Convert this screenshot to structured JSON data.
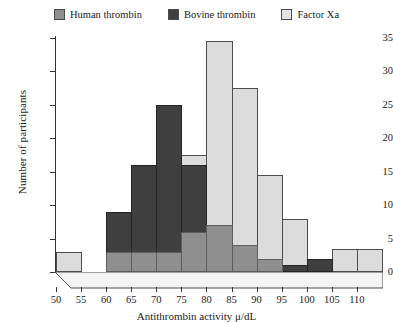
{
  "chart_data": {
    "type": "bar",
    "title": "",
    "xlabel": "Antithrombin activity μ/dL",
    "ylabel": "Number of participants",
    "xlim": [
      50,
      115
    ],
    "ylim": [
      0,
      35
    ],
    "ytick_step": 5,
    "xtick_step": 5,
    "grid": false,
    "legend_position": "top-center",
    "bin_width": 5,
    "bin_starts": [
      50,
      55,
      60,
      65,
      70,
      75,
      80,
      85,
      90,
      95,
      100,
      105,
      110
    ],
    "categories": [
      "50-55",
      "55-60",
      "60-65",
      "65-70",
      "70-75",
      "75-80",
      "80-85",
      "85-90",
      "90-95",
      "95-100",
      "100-105",
      "105-110",
      "110-115"
    ],
    "series": [
      {
        "name": "Human thrombin",
        "color": "#8f8f8f",
        "values": [
          0,
          0,
          3,
          3,
          3,
          6,
          7,
          4,
          2,
          0,
          0,
          0,
          0
        ]
      },
      {
        "name": "Bovine thrombin",
        "color": "#3f3f3f",
        "values": [
          0,
          0,
          9,
          16,
          25,
          16,
          3,
          1,
          1,
          1,
          2,
          0,
          0
        ]
      },
      {
        "name": "Factor Xa",
        "color": "#dcdcdc",
        "values": [
          3,
          0,
          0,
          0,
          0,
          17.5,
          34.5,
          27.5,
          14.5,
          8,
          0,
          3.5,
          3.5
        ]
      }
    ],
    "ytick_labels": [
      "0",
      "5",
      "10",
      "15",
      "20",
      "25",
      "30",
      "35"
    ],
    "xtick_labels": [
      "50",
      "55",
      "60",
      "65",
      "70",
      "75",
      "80",
      "85",
      "90",
      "95",
      "100",
      "105",
      "110"
    ]
  },
  "legend": {
    "items": [
      {
        "label": "Human thrombin",
        "swatch_color": "#8f8f8f"
      },
      {
        "label": "Bovine thrombin",
        "swatch_color": "#3f3f3f"
      },
      {
        "label": "Factor Xa",
        "swatch_color": "#e3e3e3"
      }
    ]
  },
  "axes": {
    "y_title": "Number of participants",
    "x_title": "Antithrombin activity μ/dL"
  }
}
